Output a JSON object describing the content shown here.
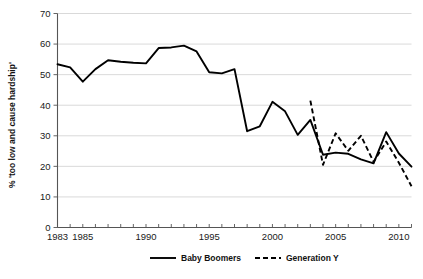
{
  "chart_data": {
    "type": "line",
    "title": "",
    "xlabel": "",
    "ylabel": "% 'too low and cause hardship'",
    "xlim": [
      1983,
      2011
    ],
    "ylim": [
      0,
      70
    ],
    "grid": true,
    "legend_position": "bottom",
    "y_ticks": [
      0,
      10,
      20,
      30,
      40,
      50,
      60,
      70
    ],
    "y_tick_labels": [
      "0",
      "10",
      "20",
      "30",
      "40",
      "50",
      "60",
      "70"
    ],
    "x_ticks": [
      1983,
      1985,
      1990,
      1995,
      2000,
      2005,
      2010
    ],
    "x_tick_labels": [
      "1983",
      "1985",
      "1990",
      "1995",
      "2000",
      "2005",
      "2010"
    ],
    "x_minor_ticks": [
      1983,
      1984,
      1985,
      1986,
      1987,
      1988,
      1989,
      1990,
      1991,
      1992,
      1993,
      1994,
      1995,
      1996,
      1997,
      1998,
      1999,
      2000,
      2001,
      2002,
      2003,
      2004,
      2005,
      2006,
      2007,
      2008,
      2009,
      2010,
      2011
    ],
    "series": [
      {
        "name": "Baby Boomers",
        "style": "solid",
        "x": [
          1983,
          1984,
          1985,
          1986,
          1987,
          1988,
          1989,
          1990,
          1991,
          1992,
          1993,
          1994,
          1995,
          1996,
          1997,
          1998,
          1999,
          2000,
          2001,
          2002,
          2003,
          2004,
          2005,
          2006,
          2007,
          2008,
          2009,
          2010,
          2011
        ],
        "values": [
          53.4,
          52.4,
          47.7,
          51.8,
          54.7,
          54.2,
          53.9,
          53.7,
          58.7,
          58.9,
          59.5,
          57.6,
          50.8,
          50.4,
          51.8,
          31.5,
          33.1,
          41.1,
          38.0,
          30.3,
          35.2,
          23.8,
          24.5,
          24.1,
          22.3,
          21.0,
          31.2,
          24.2,
          19.9
        ]
      },
      {
        "name": "Generation Y",
        "style": "dashed",
        "x": [
          2003,
          2004,
          2005,
          2006,
          2007,
          2008,
          2009,
          2010,
          2011
        ],
        "values": [
          41.5,
          20.5,
          30.8,
          25.1,
          30.0,
          21.5,
          28.1,
          21.2,
          13.5
        ]
      }
    ]
  },
  "legend": {
    "items": [
      {
        "label": "Baby Boomers",
        "style": "solid"
      },
      {
        "label": "Generation Y",
        "style": "dashed"
      }
    ]
  },
  "colors": {
    "series": "#000000",
    "gridline": "#c9c9c9",
    "axis": "#555555",
    "text": "#1a1a1a",
    "background": "#ffffff"
  }
}
